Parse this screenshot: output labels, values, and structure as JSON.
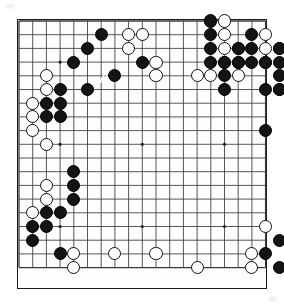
{
  "app": {
    "title": "Go Board Position Diagram",
    "kind": "go-board-diagram"
  },
  "board": {
    "size": 19,
    "size_label": "19x19",
    "grid_spacing_px": 13.7,
    "origin_x_px": 2,
    "origin_y_px": 2,
    "line_color": "#3a3a3a",
    "border_color": "#1a1a1a",
    "background_color": "#fdfdfb",
    "black_color": "#141414",
    "white_color": "#fcfcfc",
    "stone_radius_px": 6.6,
    "star_points": [
      [
        3,
        3
      ],
      [
        9,
        3
      ],
      [
        15,
        3
      ],
      [
        3,
        9
      ],
      [
        9,
        9
      ],
      [
        15,
        9
      ],
      [
        3,
        15
      ],
      [
        9,
        15
      ],
      [
        15,
        15
      ]
    ]
  },
  "stones": {
    "black": [
      [
        14,
        0
      ],
      [
        6,
        1
      ],
      [
        14,
        1
      ],
      [
        17,
        1
      ],
      [
        5,
        2
      ],
      [
        14,
        2
      ],
      [
        16,
        2
      ],
      [
        17,
        2
      ],
      [
        19,
        2
      ],
      [
        4,
        3
      ],
      [
        9,
        3
      ],
      [
        14,
        3
      ],
      [
        15,
        3
      ],
      [
        16,
        3
      ],
      [
        17,
        3
      ],
      [
        18,
        3
      ],
      [
        19,
        3
      ],
      [
        21,
        3
      ],
      [
        7,
        4
      ],
      [
        15,
        4
      ],
      [
        19,
        4
      ],
      [
        3,
        5
      ],
      [
        5,
        5
      ],
      [
        15,
        5
      ],
      [
        18,
        5
      ],
      [
        19,
        5
      ],
      [
        21,
        5
      ],
      [
        2,
        6
      ],
      [
        3,
        6
      ],
      [
        2,
        7
      ],
      [
        3,
        7
      ],
      [
        18,
        8
      ],
      [
        4,
        11
      ],
      [
        4,
        12
      ],
      [
        4,
        13
      ],
      [
        2,
        14
      ],
      [
        3,
        14
      ],
      [
        1,
        15
      ],
      [
        2,
        15
      ],
      [
        1,
        16
      ],
      [
        19,
        16
      ],
      [
        3,
        17
      ],
      [
        18,
        17
      ],
      [
        19,
        18
      ]
    ],
    "white": [
      [
        15,
        0
      ],
      [
        8,
        1
      ],
      [
        9,
        1
      ],
      [
        15,
        1
      ],
      [
        18,
        1
      ],
      [
        8,
        2
      ],
      [
        15,
        2
      ],
      [
        16,
        2
      ],
      [
        18,
        2
      ],
      [
        19,
        2
      ],
      [
        20,
        2
      ],
      [
        10,
        3
      ],
      [
        15,
        3
      ],
      [
        16,
        3
      ],
      [
        18,
        3
      ],
      [
        20,
        3
      ],
      [
        2,
        4
      ],
      [
        10,
        4
      ],
      [
        13,
        4
      ],
      [
        14,
        4
      ],
      [
        16,
        4
      ],
      [
        20,
        4
      ],
      [
        21,
        4
      ],
      [
        2,
        5
      ],
      [
        19,
        5
      ],
      [
        1,
        6
      ],
      [
        1,
        7
      ],
      [
        1,
        8
      ],
      [
        2,
        9
      ],
      [
        2,
        12
      ],
      [
        2,
        13
      ],
      [
        1,
        14
      ],
      [
        18,
        15
      ],
      [
        4,
        17
      ],
      [
        7,
        17
      ],
      [
        10,
        17
      ],
      [
        17,
        17
      ],
      [
        13,
        18
      ],
      [
        17,
        18
      ],
      [
        4,
        18
      ]
    ]
  },
  "markers": [
    {
      "type": "triangle",
      "label": "last-move-marker",
      "color": "#ffffff",
      "on_stone_color": "black",
      "x_px": 88,
      "y_px": 59
    }
  ],
  "legend": {
    "black_label": "Black stone",
    "white_label": "White stone",
    "marker_label": "Triangle marker (marked black stone)"
  }
}
